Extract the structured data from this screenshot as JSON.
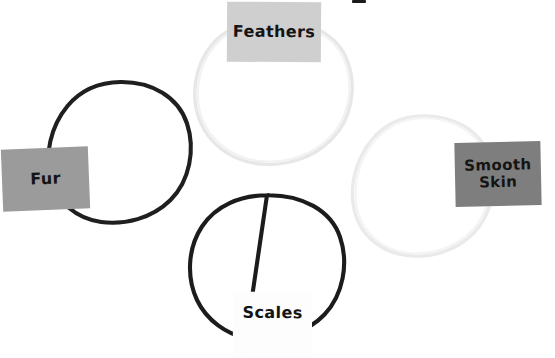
{
  "page": {
    "background_color": "#ffffff",
    "width": 555,
    "height": 358,
    "kind": "worksheet-diagram"
  },
  "diagram": {
    "type": "overlapping-circles",
    "circle_count": 4,
    "arrangement": "diamond",
    "circles": [
      {
        "id": "fur",
        "label": "Fur",
        "stroke_color": "#1e1e1e",
        "stroke_weight": "thick",
        "center_x": 120,
        "center_y": 152,
        "radius": 72
      },
      {
        "id": "feathers",
        "label": "Feathers",
        "stroke_color": "#e9e9e9",
        "stroke_weight": "thin",
        "center_x": 273,
        "center_y": 92,
        "radius": 73
      },
      {
        "id": "smooth-skin",
        "label": "Smooth\nSkin",
        "stroke_color": "#ececec",
        "stroke_weight": "thin",
        "center_x": 423,
        "center_y": 186,
        "radius": 72
      },
      {
        "id": "scales",
        "label": "Scales",
        "stroke_color": "#1c1c1c",
        "stroke_weight": "thick",
        "center_x": 267,
        "center_y": 266,
        "radius": 73
      }
    ]
  },
  "labels": {
    "fur": {
      "text": "Fur",
      "box_color": "#9b9b9b",
      "text_color": "#141414"
    },
    "feathers": {
      "text": "Feathers",
      "box_color": "#cfcfcf",
      "text_color": "#141414"
    },
    "smooth_skin": {
      "text": "Smooth\nSkin",
      "box_color": "#7e7e7e",
      "text_color": "#141414"
    },
    "scales": {
      "text": "Scales",
      "box_color": "#fdfdfd",
      "text_color": "#141414"
    }
  }
}
